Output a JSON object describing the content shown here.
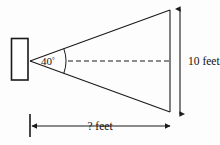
{
  "diagram": {
    "background_color": "#fdfdfd",
    "stroke_color": "#1a1a1a",
    "text_color": "#111111",
    "angle": {
      "value": "40",
      "degree_symbol": "°",
      "label": "40°",
      "vertex_x": 30,
      "vertex_y": 61,
      "arc_radius": 36
    },
    "vertical_dimension": {
      "label": "10 feet",
      "value": "10",
      "unit": "feet",
      "arrow_x": 180,
      "arrow_top_y": 8,
      "arrow_bottom_y": 115,
      "text_x": 188,
      "text_y": 65
    },
    "horizontal_dimension": {
      "label": "? feet",
      "value": "?",
      "unit": "feet",
      "arrow_y": 126,
      "arrow_left_x": 30,
      "arrow_right_x": 172,
      "text_x": 100,
      "text_y": 130
    },
    "rectangle": {
      "x": 11,
      "y": 38,
      "width": 17,
      "height": 42,
      "fill": "#ffffff"
    },
    "triangle": {
      "apex_x": 30,
      "apex_y": 61,
      "top_right_x": 170,
      "top_right_y": 10,
      "bottom_right_x": 170,
      "bottom_right_y": 112
    },
    "centerline": {
      "start_x": 68,
      "end_x": 172,
      "y": 61,
      "dash_pattern": "5,3"
    }
  }
}
